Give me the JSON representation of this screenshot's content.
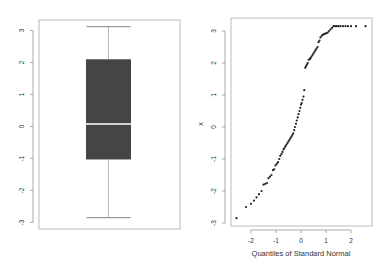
{
  "chart_data": [
    {
      "type": "box",
      "title": "",
      "xlabel": "",
      "ylabel": "",
      "yticks": [
        "-3",
        "-2",
        "-1",
        "0",
        "1",
        "2",
        "3"
      ],
      "ylim": [
        -3.05,
        3.4
      ],
      "box": {
        "min": -2.85,
        "q1": -1.03,
        "median": 0.08,
        "q3": 2.1,
        "max": 3.12
      },
      "colors": {
        "box_fill": "#454545",
        "median": "#ffffff",
        "whisker": "#999999"
      }
    },
    {
      "type": "scatter",
      "subtype": "qqnorm",
      "title": "",
      "xlabel": "Quantiles of Standard Normal",
      "ylabel": "x",
      "xticks": [
        "-2",
        "-1",
        "0",
        "1",
        "2"
      ],
      "yticks": [
        "-3",
        "-2",
        "-1",
        "0",
        "1",
        "2",
        "3"
      ],
      "xlim": [
        -2.8,
        2.8
      ],
      "ylim": [
        -3.1,
        3.4
      ],
      "x": [
        -2.58,
        -2.2,
        -2.0,
        -1.88,
        -1.78,
        -1.68,
        -1.58,
        -1.5,
        -1.43,
        -1.36,
        -1.3,
        -1.24,
        -1.18,
        -1.12,
        -1.07,
        -1.02,
        -0.97,
        -0.92,
        -0.87,
        -0.83,
        -0.78,
        -0.74,
        -0.7,
        -0.66,
        -0.62,
        -0.58,
        -0.54,
        -0.5,
        -0.46,
        -0.42,
        -0.38,
        -0.35,
        -0.31,
        -0.27,
        -0.24,
        -0.2,
        -0.17,
        -0.13,
        -0.1,
        -0.06,
        -0.03,
        0.0,
        0.03,
        0.06,
        0.1,
        0.13,
        0.17,
        0.2,
        0.24,
        0.27,
        0.31,
        0.35,
        0.38,
        0.42,
        0.46,
        0.5,
        0.54,
        0.58,
        0.62,
        0.66,
        0.7,
        0.74,
        0.78,
        0.83,
        0.87,
        0.92,
        0.97,
        1.02,
        1.07,
        1.12,
        1.18,
        1.24,
        1.3,
        1.36,
        1.43,
        1.5,
        1.58,
        1.68,
        1.78,
        1.88,
        2.0,
        2.2,
        2.58
      ],
      "y": [
        -2.85,
        -2.5,
        -2.4,
        -2.3,
        -2.2,
        -2.1,
        -2.0,
        -1.8,
        -1.78,
        -1.75,
        -1.6,
        -1.55,
        -1.5,
        -1.35,
        -1.32,
        -1.2,
        -1.15,
        -1.1,
        -1.0,
        -0.9,
        -0.85,
        -0.78,
        -0.7,
        -0.65,
        -0.6,
        -0.55,
        -0.5,
        -0.45,
        -0.4,
        -0.35,
        -0.3,
        -0.25,
        -0.2,
        -0.1,
        0.0,
        0.1,
        0.2,
        0.3,
        0.4,
        0.5,
        0.6,
        0.7,
        0.75,
        0.85,
        0.95,
        1.15,
        1.85,
        1.9,
        1.95,
        2.0,
        2.1,
        2.12,
        2.15,
        2.2,
        2.25,
        2.3,
        2.35,
        2.4,
        2.45,
        2.5,
        2.65,
        2.7,
        2.8,
        2.85,
        2.88,
        2.9,
        2.92,
        2.93,
        2.95,
        3.0,
        3.05,
        3.1,
        3.15,
        3.15,
        3.15,
        3.15,
        3.15,
        3.15,
        3.15,
        3.15,
        3.15,
        3.15,
        3.15
      ],
      "colors": {
        "points": "#222222"
      }
    }
  ]
}
